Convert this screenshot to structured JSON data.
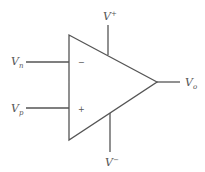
{
  "diagram": {
    "type": "op-amp symbol",
    "labels": {
      "inverting_input": {
        "base": "V",
        "sub": "n"
      },
      "noninverting_input": {
        "base": "V",
        "sub": "p"
      },
      "output": {
        "base": "V",
        "sub": "o"
      },
      "positive_supply": {
        "base": "V",
        "sup": "+"
      },
      "negative_supply": {
        "base": "V",
        "sup": "−"
      }
    },
    "input_signs": {
      "inverting": "−",
      "noninverting": "+"
    },
    "colors": {
      "line": "#555555",
      "background": "#ffffff"
    }
  }
}
